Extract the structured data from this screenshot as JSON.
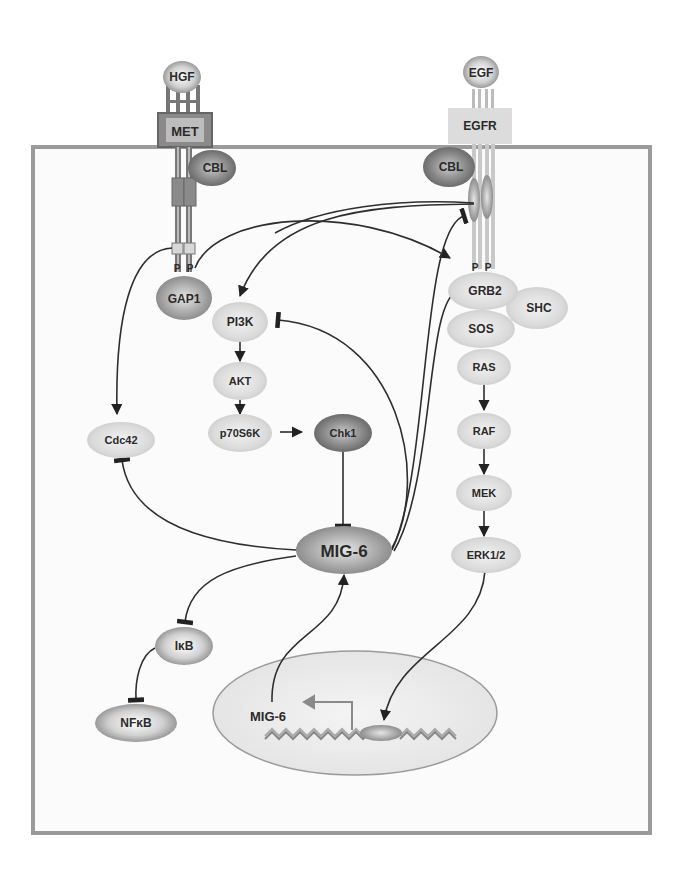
{
  "diagram": {
    "type": "signaling-pathway",
    "cell_boundary": {
      "x": 33,
      "y": 147,
      "w": 617,
      "h": 686
    },
    "ligands": {
      "hgf": "HGF",
      "egf": "EGF"
    },
    "receptors": {
      "met": "MET",
      "egfr": "EGFR"
    },
    "nodes": {
      "cbl_met": "CBL",
      "cbl_egfr": "CBL",
      "phospho_met_1": "P",
      "phospho_met_2": "P",
      "phospho_egfr_1": "P",
      "phospho_egfr_2": "P",
      "gap1": "GAP1",
      "pi3k": "PI3K",
      "akt": "AKT",
      "p70s6k": "p70S6K",
      "chk1": "Chk1",
      "cdc42": "Cdc42",
      "mig6": "MIG-6",
      "ikb": "IκB",
      "nfkb": "NFκB",
      "grb2": "GRB2",
      "shc": "SHC",
      "sos": "SOS",
      "ras": "RAS",
      "raf": "RAF",
      "mek": "MEK",
      "erk": "ERK1/2",
      "gene_mig6": "MIG-6"
    },
    "edges": [
      {
        "from": "MET",
        "to": "Cdc42",
        "type": "activation"
      },
      {
        "from": "MET",
        "to": "GRB2",
        "type": "activation"
      },
      {
        "from": "EGFR",
        "to": "PI3K",
        "type": "activation"
      },
      {
        "from": "PI3K",
        "to": "AKT",
        "type": "activation"
      },
      {
        "from": "AKT",
        "to": "p70S6K",
        "type": "activation"
      },
      {
        "from": "p70S6K",
        "to": "Chk1",
        "type": "activation"
      },
      {
        "from": "Chk1",
        "to": "MIG-6",
        "type": "inhibition"
      },
      {
        "from": "MIG-6",
        "to": "Cdc42",
        "type": "inhibition"
      },
      {
        "from": "MIG-6",
        "to": "PI3K",
        "type": "inhibition"
      },
      {
        "from": "MIG-6",
        "to": "EGFR",
        "type": "inhibition"
      },
      {
        "from": "MIG-6",
        "to": "GRB2",
        "type": "inhibition"
      },
      {
        "from": "MIG-6",
        "to": "IκB",
        "type": "inhibition"
      },
      {
        "from": "IκB",
        "to": "NFκB",
        "type": "inhibition"
      },
      {
        "from": "RAS",
        "to": "RAF",
        "type": "activation"
      },
      {
        "from": "RAF",
        "to": "MEK",
        "type": "activation"
      },
      {
        "from": "MEK",
        "to": "ERK1/2",
        "type": "activation"
      },
      {
        "from": "ERK1/2",
        "to": "nucleus-transcription-factor",
        "type": "activation"
      },
      {
        "from": "MIG-6 gene",
        "to": "MIG-6",
        "type": "activation"
      }
    ],
    "colors": {
      "dark_node": "#6e6e6e",
      "mid_node": "#9a9a9a",
      "light_node": "#d6d6d6",
      "receptor_met": "#7a7a7a",
      "receptor_egfr": "#dcdcdc",
      "membrane": "#9b9b9b",
      "nucleus_fill": "#ececec",
      "line": "#333333"
    }
  }
}
